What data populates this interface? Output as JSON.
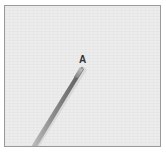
{
  "figure": {
    "point_label": "A",
    "colors": {
      "background": "#ececec",
      "border": "#9a9a9a",
      "rod_dark": "#5a5a5a",
      "rod_mid": "#8a8a8a",
      "rod_light": "#c4c4c4",
      "label": "#333333"
    }
  }
}
